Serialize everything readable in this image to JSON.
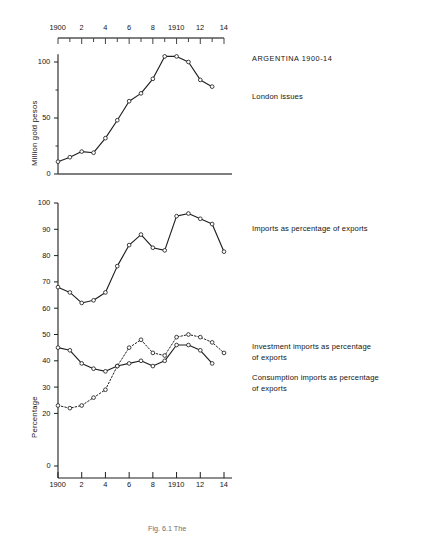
{
  "figure": {
    "title_right": "ARGENTINA 1900-14",
    "caption": "Fig. 6.1  The",
    "axis_top": {
      "label": "year",
      "ticks": [
        {
          "value": 1900,
          "label": "1900"
        },
        {
          "value": 1901,
          "label": ""
        },
        {
          "value": 1902,
          "label": "2"
        },
        {
          "value": 1903,
          "label": ""
        },
        {
          "value": 1904,
          "label": "4"
        },
        {
          "value": 1905,
          "label": ""
        },
        {
          "value": 1906,
          "label": "6"
        },
        {
          "value": 1907,
          "label": ""
        },
        {
          "value": 1908,
          "label": "8"
        },
        {
          "value": 1909,
          "label": ""
        },
        {
          "value": 1910,
          "label": "1910"
        },
        {
          "value": 1911,
          "label": ""
        },
        {
          "value": 1912,
          "label": "12"
        },
        {
          "value": 1913,
          "label": ""
        },
        {
          "value": 1914,
          "label": "14"
        }
      ]
    },
    "axis_bottom": {
      "ticks": [
        {
          "value": 1900,
          "label": "1900"
        },
        {
          "value": 1902,
          "label": "2"
        },
        {
          "value": 1904,
          "label": "4"
        },
        {
          "value": 1906,
          "label": "6"
        },
        {
          "value": 1908,
          "label": "8"
        },
        {
          "value": 1910,
          "label": "1910"
        },
        {
          "value": 1912,
          "label": "12"
        },
        {
          "value": 1914,
          "label": "14"
        }
      ]
    },
    "legend_right": [
      {
        "key": "london",
        "lines": [
          "London issues"
        ]
      },
      {
        "key": "imports",
        "lines": [
          "Imports as percentage of exports"
        ]
      },
      {
        "key": "investment",
        "lines": [
          "Investment imports as percentage",
          "of exports"
        ]
      },
      {
        "key": "consumption",
        "lines": [
          "Consumption imports as percentage",
          "of exports"
        ]
      }
    ]
  },
  "chart_data": [
    {
      "id": "london-issues",
      "type": "line",
      "title": "ARGENTINA 1900-14",
      "subtitle": "London issues",
      "xlabel": "",
      "ylabel": "Million gold pesos",
      "xlim": [
        1900,
        1914
      ],
      "ylim": [
        0,
        110
      ],
      "yticks": [
        0,
        50,
        100
      ],
      "ytick_labels": [
        "0",
        "50",
        "100"
      ],
      "grid": false,
      "legend_position": "right",
      "marker": "open-circle",
      "linestyle": "solid",
      "x": [
        1900,
        1901,
        1902,
        1903,
        1904,
        1905,
        1906,
        1907,
        1908,
        1909,
        1910,
        1911,
        1912,
        1913
      ],
      "values": [
        11,
        15,
        20,
        19,
        32,
        48,
        65,
        72,
        85,
        105,
        105,
        100,
        84,
        78
      ]
    },
    {
      "id": "import-ratios",
      "type": "line",
      "title": "",
      "xlabel": "",
      "ylabel": "Percentage",
      "xlim": [
        1900,
        1914
      ],
      "ylim": [
        0,
        100
      ],
      "yticks": [
        0,
        20,
        30,
        40,
        50,
        60,
        70,
        80,
        90,
        100
      ],
      "ytick_labels": [
        "0",
        "20",
        "30",
        "40",
        "50",
        "60",
        "70",
        "80",
        "90",
        "100"
      ],
      "grid": false,
      "legend_position": "right",
      "x": [
        1900,
        1901,
        1902,
        1903,
        1904,
        1905,
        1906,
        1907,
        1908,
        1909,
        1910,
        1911,
        1912,
        1913
      ],
      "series": [
        {
          "name": "Imports as percentage of exports",
          "linestyle": "solid",
          "marker": "open-circle",
          "values": [
            68,
            66,
            62,
            63,
            66,
            76,
            84,
            88,
            83,
            82,
            95,
            96,
            94,
            92,
            81.5
          ],
          "x": [
            1900,
            1901,
            1902,
            1903,
            1904,
            1905,
            1906,
            1907,
            1908,
            1909,
            1910,
            1911,
            1912,
            1913,
            1914
          ]
        },
        {
          "name": "Investment imports as percentage of exports",
          "linestyle": "dotted",
          "marker": "open-circle",
          "values": [
            23,
            22,
            23,
            26,
            29,
            38,
            45,
            48,
            43,
            42,
            49,
            50,
            49,
            47,
            43
          ],
          "x": [
            1900,
            1901,
            1902,
            1903,
            1904,
            1905,
            1906,
            1907,
            1908,
            1909,
            1910,
            1911,
            1912,
            1913,
            1914
          ]
        },
        {
          "name": "Consumption imports as percentage of exports",
          "linestyle": "solid",
          "marker": "open-circle",
          "values": [
            45,
            44,
            39,
            37,
            36,
            38,
            39,
            40,
            38,
            40,
            46,
            46,
            44,
            39
          ],
          "x": [
            1900,
            1901,
            1902,
            1903,
            1904,
            1905,
            1906,
            1907,
            1908,
            1909,
            1910,
            1911,
            1912,
            1913
          ]
        }
      ]
    }
  ]
}
